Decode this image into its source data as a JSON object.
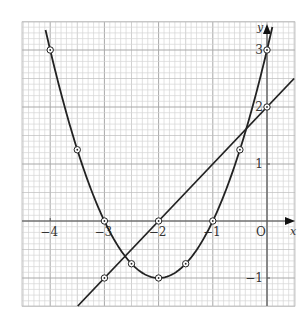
{
  "chart_data": {
    "type": "line",
    "title": "",
    "xlabel": "x",
    "ylabel": "y",
    "xlim": [
      -4.5,
      0.5
    ],
    "ylim": [
      -1.5,
      3.4
    ],
    "grid": true,
    "x_ticks": [
      {
        "value": -4,
        "label": "−4"
      },
      {
        "value": -3,
        "label": "−3"
      },
      {
        "value": -2,
        "label": "−2"
      },
      {
        "value": -1,
        "label": "−1"
      },
      {
        "value": 0,
        "label": "O"
      }
    ],
    "y_ticks": [
      {
        "value": 3,
        "label": "3"
      },
      {
        "value": 2,
        "label": "2"
      },
      {
        "value": 1,
        "label": "1"
      },
      {
        "value": -1,
        "label": "−1"
      }
    ],
    "series": [
      {
        "name": "parabola y = x² + 4x + 3",
        "kind": "curve",
        "x_range": [
          -4.15,
          0.12
        ],
        "points": [
          {
            "x": -4,
            "y": 3
          },
          {
            "x": -3.5,
            "y": 1.25
          },
          {
            "x": -3,
            "y": 0
          },
          {
            "x": -2.5,
            "y": -0.75
          },
          {
            "x": -2,
            "y": -1
          },
          {
            "x": -1.5,
            "y": -0.75
          },
          {
            "x": -1,
            "y": 0
          },
          {
            "x": -0.5,
            "y": 1.25
          },
          {
            "x": 0,
            "y": 3
          }
        ]
      },
      {
        "name": "line y = x + 2",
        "kind": "line",
        "x_range": [
          -3.5,
          0.5
        ],
        "points": [
          {
            "x": -3,
            "y": -1
          },
          {
            "x": -2,
            "y": 0
          },
          {
            "x": 0,
            "y": 2
          }
        ]
      }
    ],
    "legend": null,
    "colors": {
      "curve": "#222222",
      "grid_minor": "#d6d6d6",
      "grid_major": "#a8a8a8",
      "axis": "#555555"
    }
  }
}
